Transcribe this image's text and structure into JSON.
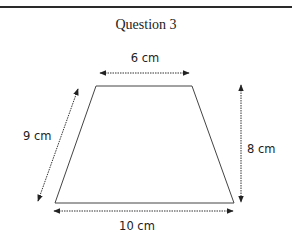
{
  "title": "Question 3",
  "shape": "trapezium",
  "labels": {
    "top": "6 cm",
    "slant": "9 cm",
    "height": "8 cm",
    "bottom": "10 cm"
  },
  "colors": {
    "line": "#333333",
    "text": "#222222"
  }
}
